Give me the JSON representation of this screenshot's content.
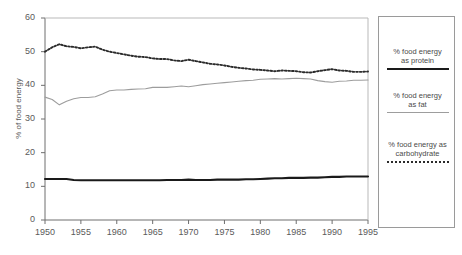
{
  "chart_data": {
    "type": "line",
    "title": "",
    "xlabel": "",
    "ylabel": "% of food energy",
    "xlim": [
      1950,
      1995
    ],
    "ylim": [
      0,
      60
    ],
    "ytick_values": [
      0,
      10,
      20,
      30,
      40,
      50,
      60
    ],
    "ytick_labels": [
      "0",
      "10",
      "20",
      "30",
      "40",
      "50",
      "60"
    ],
    "xtick_values": [
      1950,
      1955,
      1960,
      1965,
      1970,
      1975,
      1980,
      1985,
      1990,
      1995
    ],
    "xtick_labels": [
      "1950",
      "1955",
      "1960",
      "1965",
      "1970",
      "1975",
      "1980",
      "1985",
      "1990",
      "1995"
    ],
    "grid": false,
    "legend_position": "right-outside",
    "x": [
      1950,
      1951,
      1952,
      1953,
      1954,
      1955,
      1956,
      1957,
      1958,
      1959,
      1960,
      1961,
      1962,
      1963,
      1964,
      1965,
      1966,
      1967,
      1968,
      1969,
      1970,
      1971,
      1972,
      1973,
      1974,
      1975,
      1976,
      1977,
      1978,
      1979,
      1980,
      1981,
      1982,
      1983,
      1984,
      1985,
      1986,
      1987,
      1988,
      1989,
      1990,
      1991,
      1992,
      1993,
      1994,
      1995
    ],
    "series": [
      {
        "name": "% food energy as carbohydrate",
        "style": "dotted",
        "color": "#2b2b2b",
        "values": [
          50.0,
          51.3,
          52.2,
          51.6,
          51.4,
          51.0,
          51.3,
          51.5,
          50.6,
          50.0,
          49.6,
          49.2,
          48.8,
          48.5,
          48.4,
          48.0,
          47.8,
          47.8,
          47.4,
          47.2,
          47.6,
          47.2,
          46.8,
          46.4,
          46.2,
          45.9,
          45.5,
          45.2,
          45.0,
          44.7,
          44.6,
          44.4,
          44.2,
          44.4,
          44.3,
          44.2,
          43.9,
          43.8,
          44.2,
          44.5,
          44.8,
          44.4,
          44.3,
          44.0,
          44.0,
          44.1
        ]
      },
      {
        "name": "% food energy as fat",
        "style": "solid-thin",
        "color": "#9d9d9d",
        "values": [
          36.5,
          35.8,
          34.2,
          35.3,
          36.0,
          36.4,
          36.4,
          36.6,
          37.4,
          38.4,
          38.6,
          38.6,
          38.8,
          38.9,
          39.0,
          39.4,
          39.4,
          39.4,
          39.6,
          39.8,
          39.6,
          39.9,
          40.2,
          40.4,
          40.6,
          40.8,
          41.0,
          41.2,
          41.4,
          41.5,
          41.8,
          41.9,
          42.0,
          41.9,
          42.0,
          42.1,
          42.0,
          41.9,
          41.4,
          41.1,
          40.9,
          41.2,
          41.3,
          41.5,
          41.5,
          41.6
        ]
      },
      {
        "name": "% food energy as protein",
        "style": "solid-thick",
        "color": "#1a1a1a",
        "values": [
          12.2,
          12.2,
          12.2,
          12.2,
          11.9,
          11.8,
          11.8,
          11.8,
          11.8,
          11.8,
          11.8,
          11.8,
          11.8,
          11.8,
          11.8,
          11.8,
          11.8,
          11.9,
          11.9,
          11.9,
          12.0,
          11.9,
          11.9,
          11.9,
          12.0,
          12.0,
          12.0,
          12.0,
          12.1,
          12.1,
          12.2,
          12.3,
          12.4,
          12.4,
          12.5,
          12.5,
          12.5,
          12.6,
          12.6,
          12.7,
          12.8,
          12.8,
          12.9,
          12.9,
          12.9,
          12.9
        ]
      }
    ]
  },
  "legend": {
    "items": [
      {
        "label_line1": "% food energy",
        "label_line2": "as protein",
        "swatch": "solid-thick-black-line"
      },
      {
        "label_line1": "% food energy",
        "label_line2": "as fat",
        "swatch": "solid-thin-gray-line"
      },
      {
        "label_line1": "% food energy as",
        "label_line2": "carbohydrate",
        "swatch": "dotted-black-line"
      }
    ]
  },
  "colors": {
    "protein": "#1a1a1a",
    "fat": "#9d9d9d",
    "carbohydrate": "#2b2b2b",
    "axis": "#6e6e6e",
    "background": "#ffffff"
  }
}
